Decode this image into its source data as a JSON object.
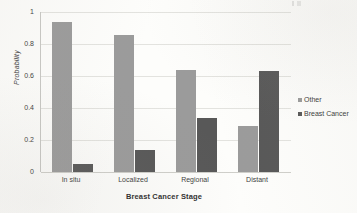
{
  "chart_data": {
    "type": "bar",
    "title": "",
    "subtitle": "",
    "xlabel": "Breast Cancer Stage",
    "ylabel": "Probability",
    "categories": [
      "In situ",
      "Localized",
      "Regional",
      "Distant"
    ],
    "series": [
      {
        "name": "Other",
        "values": [
          0.94,
          0.855,
          0.64,
          0.29
        ],
        "color": "#9b9b9b"
      },
      {
        "name": "Breast Cancer",
        "values": [
          0.05,
          0.135,
          0.335,
          0.63
        ],
        "color": "#585858"
      }
    ],
    "ylim": [
      0,
      1
    ],
    "yticks": [
      0,
      0.2,
      0.4,
      0.6,
      0.8,
      1
    ],
    "ytick_labels": [
      "0",
      "0.2",
      "0.4",
      "0.6",
      "0.8",
      "1"
    ],
    "grid": true,
    "grid_axis": "y",
    "legend_position": "right",
    "bar_orientation": "vertical",
    "grouping": "clustered"
  },
  "legend": {
    "entries": [
      {
        "label": "Other",
        "marker": "square-swatch-light"
      },
      {
        "label": "Breast Cancer",
        "marker": "square-swatch-dark"
      }
    ]
  },
  "colors": {
    "series_other": "#9b9b9b",
    "series_breast_cancer": "#585858",
    "gridline": "#e3e3df",
    "axis_line": "#c8c8c4",
    "text": "#3a3a3a",
    "background": "#fdfdfb"
  }
}
